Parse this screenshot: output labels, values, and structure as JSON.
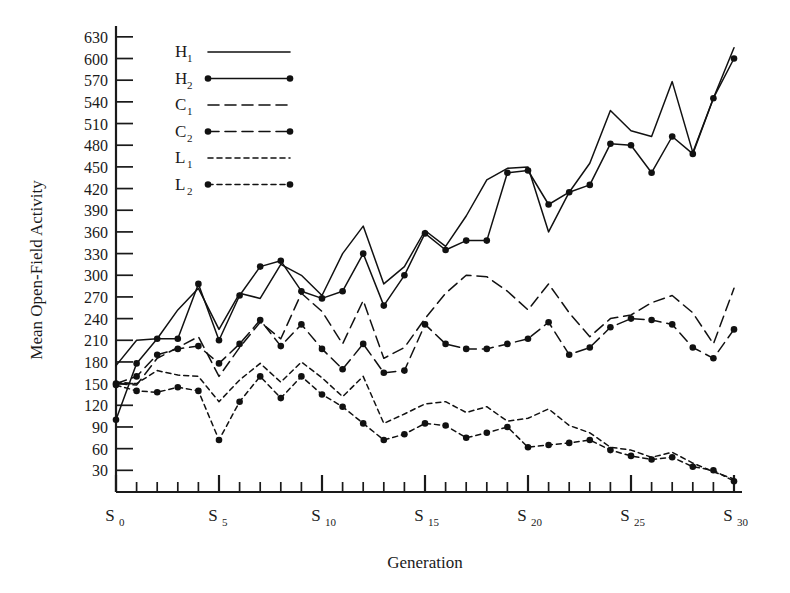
{
  "chart_data": {
    "type": "line",
    "title": "",
    "xlabel": "Generation",
    "ylabel": "Mean Open-Field Activity",
    "xlim": [
      0,
      30
    ],
    "ylim": [
      0,
      645
    ],
    "grid": false,
    "legend_position": "top-left",
    "x": [
      0,
      1,
      2,
      3,
      4,
      5,
      6,
      7,
      8,
      9,
      10,
      11,
      12,
      13,
      14,
      15,
      16,
      17,
      18,
      19,
      20,
      21,
      22,
      23,
      24,
      25,
      26,
      27,
      28,
      29,
      30
    ],
    "x_tick_labels": [
      "S0",
      "S5",
      "S10",
      "S15",
      "S20",
      "S25",
      "S30"
    ],
    "x_tick_base": "S",
    "x_tick_subscripts": [
      "0",
      "5",
      "10",
      "15",
      "20",
      "25",
      "30"
    ],
    "y_tick_labels": [
      "30",
      "60",
      "90",
      "120",
      "150",
      "180",
      "210",
      "240",
      "270",
      "300",
      "330",
      "360",
      "390",
      "420",
      "450",
      "480",
      "510",
      "540",
      "570",
      "600",
      "630"
    ],
    "y_tick_values": [
      30,
      60,
      90,
      120,
      150,
      180,
      210,
      240,
      270,
      300,
      330,
      360,
      390,
      420,
      450,
      480,
      510,
      540,
      570,
      600,
      630
    ],
    "series": [
      {
        "name": "H1",
        "label_base": "H",
        "label_sub": "1",
        "style": "solid",
        "markers": false,
        "color": "#111111",
        "values": [
          175,
          210,
          212,
          252,
          282,
          225,
          275,
          268,
          315,
          300,
          272,
          330,
          368,
          288,
          312,
          362,
          340,
          382,
          432,
          448,
          450,
          360,
          415,
          455,
          528,
          500,
          492,
          568,
          470,
          545,
          615
        ]
      },
      {
        "name": "H2",
        "label_base": "H",
        "label_sub": "2",
        "style": "solid",
        "markers": true,
        "color": "#111111",
        "values": [
          100,
          178,
          212,
          212,
          288,
          210,
          272,
          312,
          320,
          278,
          268,
          278,
          330,
          258,
          300,
          358,
          335,
          348,
          348,
          442,
          445,
          398,
          415,
          425,
          482,
          480,
          442,
          492,
          468,
          545,
          600
        ]
      },
      {
        "name": "C1",
        "label_base": "C",
        "label_sub": "1",
        "style": "dashed-long",
        "markers": false,
        "color": "#111111",
        "values": [
          150,
          148,
          185,
          200,
          215,
          160,
          200,
          235,
          212,
          275,
          250,
          205,
          265,
          185,
          200,
          240,
          275,
          300,
          298,
          278,
          252,
          288,
          248,
          215,
          240,
          245,
          262,
          272,
          248,
          205,
          282
        ]
      },
      {
        "name": "C2",
        "label_base": "C",
        "label_sub": "2",
        "style": "dashed-long",
        "markers": true,
        "color": "#111111",
        "values": [
          150,
          160,
          190,
          198,
          202,
          178,
          205,
          238,
          202,
          232,
          198,
          170,
          205,
          165,
          168,
          232,
          205,
          198,
          198,
          205,
          212,
          235,
          190,
          200,
          228,
          240,
          238,
          232,
          200,
          185,
          225
        ]
      },
      {
        "name": "L1",
        "label_base": "L",
        "label_sub": "1",
        "style": "dashed-short",
        "markers": false,
        "color": "#111111",
        "values": [
          152,
          150,
          168,
          162,
          160,
          125,
          155,
          178,
          152,
          180,
          158,
          132,
          160,
          95,
          108,
          122,
          125,
          110,
          118,
          98,
          102,
          115,
          92,
          82,
          62,
          58,
          48,
          55,
          40,
          28,
          18
        ]
      },
      {
        "name": "L2",
        "label_base": "L",
        "label_sub": "2",
        "style": "dashed-short",
        "markers": true,
        "color": "#111111",
        "values": [
          148,
          140,
          138,
          145,
          140,
          72,
          125,
          160,
          130,
          160,
          135,
          118,
          95,
          72,
          80,
          95,
          92,
          75,
          82,
          90,
          62,
          65,
          68,
          72,
          58,
          50,
          45,
          48,
          35,
          30,
          15
        ]
      }
    ]
  },
  "axes": {
    "y_label": "Mean Open-Field Activity",
    "x_label": "Generation"
  }
}
